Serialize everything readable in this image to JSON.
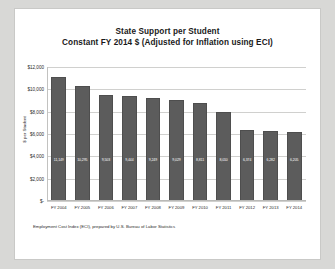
{
  "chart_data": {
    "type": "bar",
    "title": "State Support per Student",
    "subtitle": "Constant FY 2014 $ (Adjusted for Inflation using ECI)",
    "xlabel": "",
    "ylabel": "$ per Student",
    "ylim": [
      0,
      12000
    ],
    "grid": true,
    "legend": "none",
    "ytick_labels": [
      "$12,000",
      "$10,000",
      "$8,000",
      "$6,000",
      "$4,000",
      "$2,000",
      "$-"
    ],
    "ytick_values": [
      12000,
      10000,
      8000,
      6000,
      4000,
      2000,
      0
    ],
    "categories": [
      "FY 2004",
      "FY 2005",
      "FY 2006",
      "FY 2007",
      "FY 2008",
      "FY 2009",
      "FY 2010",
      "FY 2011",
      "FY 2012",
      "FY 2013",
      "FY 2014"
    ],
    "values": [
      11149,
      10295,
      9503,
      9444,
      9249,
      9029,
      8811,
      8010,
      6374,
      6282,
      6205
    ],
    "data_labels": [
      "11,149",
      "10,295",
      "9,503",
      "9,444",
      "9,249",
      "9,029",
      "8,811",
      "8,010",
      "6,374",
      "6,282",
      "6,205"
    ],
    "bar_color": "#5c5c5c",
    "plot_background": "#ffffff",
    "gridline_color": "#d0d0ce"
  },
  "footnote": {
    "text": "Employment Cost Index (ECI), prepared by U.S. Bureau of Labor Statistics"
  }
}
